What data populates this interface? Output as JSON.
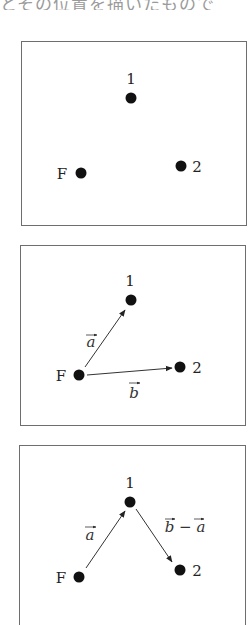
{
  "caption": {
    "text": "とその位置を描いたもので"
  },
  "colors": {
    "ink": "#1a1a1a",
    "border": "#6e6e6e",
    "arrow": "#333333"
  },
  "points": {
    "F": "F",
    "one": "1",
    "two": "2"
  },
  "vectors": {
    "a": "a",
    "b": "b",
    "b_minus_a": "b − a",
    "minus": "−"
  },
  "panels": [
    {
      "name": "points-only",
      "labels": [
        "1",
        "F",
        "2"
      ]
    },
    {
      "name": "vectors-a-b",
      "labels": [
        "1",
        "F",
        "2",
        "a",
        "b"
      ]
    },
    {
      "name": "vectors-a-b-minus-a",
      "labels": [
        "1",
        "F",
        "2",
        "a",
        "b − a"
      ]
    }
  ]
}
